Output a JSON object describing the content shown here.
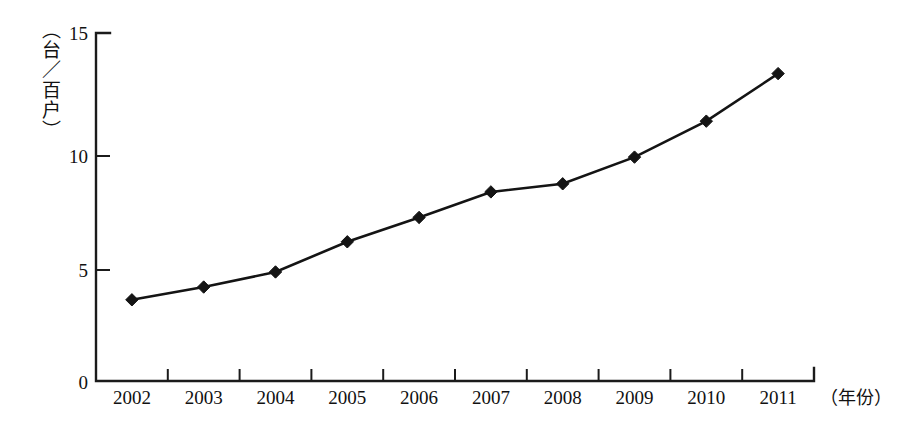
{
  "chart_data": {
    "type": "line",
    "title": "",
    "subtitle": "",
    "xlabel": "（年份）",
    "ylabel": "（台／百户）",
    "categories": [
      "2002",
      "2003",
      "2004",
      "2005",
      "2006",
      "2007",
      "2008",
      "2009",
      "2010",
      "2011"
    ],
    "values": [
      3.5,
      4.05,
      4.7,
      6.0,
      7.05,
      8.15,
      8.5,
      9.65,
      11.2,
      13.25
    ],
    "series": [
      {
        "name": "",
        "values": [
          3.5,
          4.05,
          4.7,
          6.0,
          7.05,
          8.15,
          8.5,
          9.65,
          11.2,
          13.25
        ]
      }
    ],
    "ylim": [
      0,
      15
    ],
    "yticks": [
      0,
      5,
      10,
      15
    ],
    "ytick_labels": [
      "0",
      "5",
      "10",
      "15"
    ],
    "xtick_labels": [
      "2002",
      "2003",
      "2004",
      "2005",
      "2006",
      "2007",
      "2008",
      "2009",
      "2010",
      "2011"
    ],
    "grid": false,
    "legend": false,
    "legend_position": "none",
    "marker": "diamond",
    "line_color": "#141414",
    "marker_color": "#141414",
    "axis_color": "#1b1b1b",
    "background_color": "#ffffff"
  },
  "axes": {
    "y_axis_caption": "（台／百户）",
    "x_axis_caption": "（年份）",
    "y_tick_0": "0",
    "y_tick_1": "5",
    "y_tick_2": "10",
    "y_tick_3": "15",
    "x_tick_0": "2002",
    "x_tick_1": "2003",
    "x_tick_2": "2004",
    "x_tick_3": "2005",
    "x_tick_4": "2006",
    "x_tick_5": "2007",
    "x_tick_6": "2008",
    "x_tick_7": "2009",
    "x_tick_8": "2010",
    "x_tick_9": "2011"
  }
}
